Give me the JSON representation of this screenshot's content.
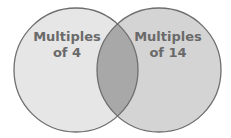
{
  "diagram": {
    "type": "venn",
    "sets": [
      {
        "label_line1": "Multiples",
        "label_line2": "of 4"
      },
      {
        "label_line1": "Multiples",
        "label_line2": "of 14"
      }
    ],
    "colors": {
      "left_fill": "#e6e6e6",
      "right_fill": "#d4d4d4",
      "overlap_fill": "#a8a8a8",
      "stroke": "#6e6e6e",
      "text": "#6a6a6a"
    }
  }
}
